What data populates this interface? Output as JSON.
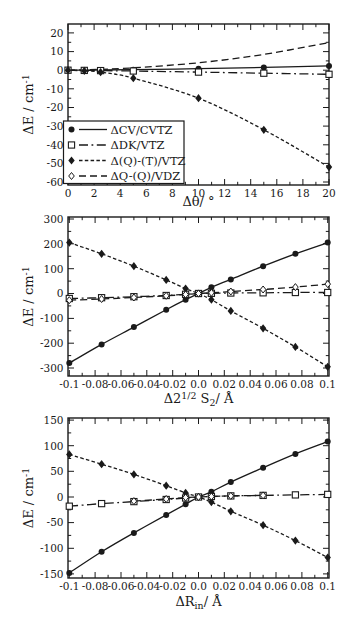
{
  "figure": {
    "ink_color": "#1a1a1a",
    "background_color": "#ffffff"
  },
  "chart_data": [
    {
      "type": "line",
      "xlabel": "Δθ/ °",
      "xlabel_parts": [
        {
          "t": "Δθ/ °"
        }
      ],
      "ylabel": "ΔE / cm⁻¹",
      "ylabel_parts": [
        {
          "t": "ΔE / cm"
        },
        {
          "t": "-1",
          "style": "sup"
        }
      ],
      "xlim": [
        0,
        20
      ],
      "ylim": [
        -61.6,
        24.8
      ],
      "xticks": [
        0,
        2,
        4,
        6,
        8,
        10,
        12,
        14,
        16,
        18,
        20
      ],
      "xtick_labels": [
        "0",
        "2",
        "4",
        "6",
        "8",
        "10",
        "12",
        "14",
        "16",
        "18",
        "20"
      ],
      "yticks": [
        20,
        10,
        0,
        -10,
        -20,
        -30,
        -40,
        -50,
        -60
      ],
      "ytick_labels": [
        "20",
        "10",
        "0",
        "-10",
        "-20",
        "-30",
        "-40",
        "-50",
        "-60"
      ],
      "xminor_step": 1,
      "yminor_step": 5,
      "grid": false,
      "legend": {
        "show": true,
        "position": "bottom-left",
        "items": [
          {
            "label": "ΔCV/CVTZ",
            "marker": "circle-filled",
            "line": "solid"
          },
          {
            "label": "ΔDK/VTZ",
            "marker": "square-open",
            "line": "dashdot"
          },
          {
            "label": "Δ(Q)-(T)/VTZ",
            "marker": "diamond-filled",
            "line": "finedash"
          },
          {
            "label": "ΔQ-(Q)/VDZ",
            "marker": "diamond-open",
            "line": "dash"
          }
        ]
      },
      "series": [
        {
          "name": "ΔCV/CVTZ",
          "marker": "circle-filled",
          "line": "solid",
          "x": [
            0,
            1.25,
            2.5,
            5,
            10,
            15,
            20
          ],
          "y": [
            0,
            0,
            0.1,
            0.3,
            0.8,
            1.5,
            2.3
          ]
        },
        {
          "name": "ΔDK/VTZ",
          "marker": "square-open",
          "line": "dashdot",
          "x": [
            0,
            1.25,
            2.5,
            5,
            10,
            15,
            20
          ],
          "y": [
            0,
            -0.1,
            -0.2,
            -0.4,
            -1,
            -1.6,
            -2.2
          ]
        },
        {
          "name": "Δ(Q)-(T)/VTZ",
          "marker": "diamond-filled",
          "line": "finedash",
          "x": [
            0,
            1.25,
            2.5,
            5,
            10,
            15,
            20
          ],
          "y": [
            0,
            -0.3,
            -1,
            -4.3,
            -15,
            -32,
            -52
          ]
        },
        {
          "name": "ΔQ-(Q)/VDZ",
          "marker": "none",
          "line": "dash",
          "x": [
            0,
            1.25,
            2.5,
            5,
            10,
            15,
            20
          ],
          "y": [
            0,
            0.2,
            0.5,
            1.3,
            4,
            8.5,
            14.8
          ]
        }
      ]
    },
    {
      "type": "line",
      "xlabel": "Δ2^1/2 S2/ Å",
      "xlabel_parts": [
        {
          "t": "Δ2"
        },
        {
          "t": "1/2",
          "style": "sup"
        },
        {
          "t": " S"
        },
        {
          "t": "2",
          "style": "sub"
        },
        {
          "t": "/ Å"
        }
      ],
      "ylabel": "ΔE / cm⁻¹",
      "ylabel_parts": [
        {
          "t": "ΔE / cm"
        },
        {
          "t": "-1",
          "style": "sup"
        }
      ],
      "xlim": [
        -0.101,
        0.101
      ],
      "ylim": [
        -332,
        308
      ],
      "xticks": [
        -0.1,
        -0.08,
        -0.06,
        -0.04,
        -0.02,
        0,
        0.02,
        0.04,
        0.06,
        0.08,
        0.1
      ],
      "xtick_labels": [
        "-0.1",
        "-0.08",
        "-0.06",
        "-0.04",
        "-0.02",
        "0.0",
        "0.02",
        "0.04",
        "0.06",
        "0.08",
        "0.1"
      ],
      "yticks": [
        300,
        200,
        100,
        0,
        -100,
        -200,
        -300
      ],
      "ytick_labels": [
        "300",
        "200",
        "100",
        "0",
        "-100",
        "-200",
        "-300"
      ],
      "xminor_step": 0.01,
      "yminor_step": 50,
      "grid": false,
      "legend": {
        "show": false
      },
      "series": [
        {
          "name": "ΔCV/CVTZ",
          "marker": "circle-filled",
          "line": "solid",
          "x": [
            -0.1,
            -0.075,
            -0.05,
            -0.025,
            -0.01,
            0,
            0.01,
            0.025,
            0.05,
            0.075,
            0.1
          ],
          "y": [
            -280,
            -205,
            -135,
            -65,
            -25,
            0,
            25,
            57,
            110,
            160,
            205
          ]
        },
        {
          "name": "ΔDK/VTZ",
          "marker": "square-open",
          "line": "dashdot",
          "x": [
            -0.1,
            -0.075,
            -0.05,
            -0.025,
            -0.01,
            0,
            0.01,
            0.025,
            0.05,
            0.075,
            0.1
          ],
          "y": [
            -20,
            -17,
            -13,
            -8,
            -3,
            0,
            1,
            2,
            3,
            4,
            4
          ]
        },
        {
          "name": "Δ(Q)-(T)/VTZ",
          "marker": "diamond-filled",
          "line": "finedash",
          "x": [
            -0.1,
            -0.075,
            -0.05,
            -0.025,
            -0.01,
            0,
            0.01,
            0.025,
            0.05,
            0.075,
            0.1
          ],
          "y": [
            205,
            160,
            110,
            55,
            20,
            0,
            -25,
            -70,
            -140,
            -215,
            -295
          ]
        },
        {
          "name": "ΔQ-(Q)/VDZ",
          "marker": "diamond-open",
          "line": "dash",
          "x": [
            -0.1,
            -0.075,
            -0.05,
            -0.025,
            -0.01,
            0,
            0.01,
            0.025,
            0.05,
            0.075,
            0.1
          ],
          "y": [
            -27,
            -22,
            -16,
            -9,
            -4,
            0,
            3,
            8,
            16,
            26,
            38
          ]
        }
      ]
    },
    {
      "type": "line",
      "xlabel": "ΔRin/ Å",
      "xlabel_parts": [
        {
          "t": "ΔR"
        },
        {
          "t": "in",
          "style": "sub"
        },
        {
          "t": "/ Å"
        }
      ],
      "ylabel": "ΔE / cm⁻¹",
      "ylabel_parts": [
        {
          "t": "ΔE / cm"
        },
        {
          "t": "-1",
          "style": "sup"
        }
      ],
      "xlim": [
        -0.101,
        0.101
      ],
      "ylim": [
        -158,
        154
      ],
      "xticks": [
        -0.1,
        -0.08,
        -0.06,
        -0.04,
        -0.02,
        0,
        0.02,
        0.04,
        0.06,
        0.08,
        0.1
      ],
      "xtick_labels": [
        "-0.1",
        "-0.08",
        "-0.06",
        "-0.04",
        "-0.02",
        "0.0",
        "0.02",
        "0.04",
        "0.06",
        "0.08",
        "0.1"
      ],
      "yticks": [
        150,
        100,
        50,
        0,
        -50,
        -100,
        -150
      ],
      "ytick_labels": [
        "150",
        "100",
        "50",
        "0",
        "-50",
        "-100",
        "-150"
      ],
      "xminor_step": 0.01,
      "yminor_step": 25,
      "grid": false,
      "legend": {
        "show": false
      },
      "series": [
        {
          "name": "ΔCV/CVTZ",
          "marker": "circle-filled",
          "line": "solid",
          "x": [
            -0.1,
            -0.075,
            -0.05,
            -0.025,
            -0.01,
            0,
            0.01,
            0.025,
            0.05,
            0.075,
            0.1
          ],
          "y": [
            -148,
            -107,
            -70,
            -35,
            -14,
            0,
            10,
            29,
            57,
            84,
            108
          ]
        },
        {
          "name": "ΔDK/VTZ",
          "marker": "square-open",
          "line": "dashdot",
          "x": [
            -0.1,
            -0.075,
            -0.05,
            -0.025,
            -0.01,
            0,
            0.01,
            0.025,
            0.05,
            0.075,
            0.1
          ],
          "y": [
            -18,
            -13,
            -9,
            -5,
            -2,
            0,
            1,
            2,
            3,
            4,
            5
          ]
        },
        {
          "name": "Δ(Q)-(T)/VTZ",
          "marker": "diamond-filled",
          "line": "finedash",
          "x": [
            -0.1,
            -0.075,
            -0.05,
            -0.025,
            -0.01,
            0,
            0.01,
            0.025,
            0.05,
            0.075,
            0.1
          ],
          "y": [
            83,
            64,
            44,
            22,
            8,
            0,
            -10,
            -28,
            -55,
            -85,
            -118
          ]
        },
        {
          "name": "ΔQ-(Q)/VDZ",
          "marker": "diamond-open",
          "line": "dash",
          "x": [
            -0.05,
            -0.025,
            -0.01,
            0,
            0.01,
            0.025,
            0.05
          ],
          "y": [
            -8,
            -4,
            -1,
            0,
            1,
            2,
            3
          ]
        }
      ]
    }
  ]
}
